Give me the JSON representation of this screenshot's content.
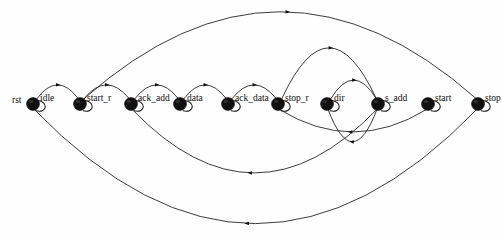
{
  "diagram": {
    "type": "finite-state-machine",
    "canvas": {
      "width": 502,
      "height": 237,
      "background": "#fefefe"
    },
    "stroke_color": "#1a1a1a",
    "node_fill": "#111111",
    "entry_label": "rst",
    "entry_label_x": 12,
    "entry_label_y": 103,
    "node_radius": 6.5,
    "node_row_y": 104,
    "nodes": [
      {
        "id": "idle",
        "label": "idle",
        "x": 33,
        "y": 104,
        "label_dx": 7,
        "label_dy": -3
      },
      {
        "id": "start_r",
        "label": "start_r",
        "x": 80,
        "y": 104,
        "label_dx": 7,
        "label_dy": -3
      },
      {
        "id": "ack_add",
        "label": "ack_add",
        "x": 131,
        "y": 104,
        "label_dx": 7,
        "label_dy": -3
      },
      {
        "id": "data",
        "label": "data",
        "x": 180,
        "y": 104,
        "label_dx": 7,
        "label_dy": -3
      },
      {
        "id": "ack_data",
        "label": "ack_data",
        "x": 228,
        "y": 104,
        "label_dx": 7,
        "label_dy": -3
      },
      {
        "id": "stop_r",
        "label": "stop_r",
        "x": 278,
        "y": 104,
        "label_dx": 7,
        "label_dy": -3
      },
      {
        "id": "dir",
        "label": "dir",
        "x": 327,
        "y": 104,
        "label_dx": 7,
        "label_dy": -3
      },
      {
        "id": "s_add",
        "label": "s_add",
        "x": 378,
        "y": 104,
        "label_dx": 7,
        "label_dy": -3
      },
      {
        "id": "start",
        "label": "start",
        "x": 428,
        "y": 104,
        "label_dx": 7,
        "label_dy": -3
      },
      {
        "id": "stop",
        "label": "stop",
        "x": 478,
        "y": 104,
        "label_dx": 7,
        "label_dy": -3
      }
    ],
    "self_loops": [
      {
        "node": "idle"
      },
      {
        "node": "start_r"
      },
      {
        "node": "ack_add"
      },
      {
        "node": "data"
      },
      {
        "node": "ack_data"
      },
      {
        "node": "stop_r"
      },
      {
        "node": "dir"
      },
      {
        "node": "s_add"
      },
      {
        "node": "start"
      },
      {
        "node": "stop"
      }
    ],
    "edges": [
      {
        "id": "e-idle-startr",
        "from": "idle",
        "to": "start_r",
        "direction": "right",
        "kind": "forward-short",
        "rise": 17
      },
      {
        "id": "e-startr-ackadd",
        "from": "start_r",
        "to": "ack_add",
        "direction": "right",
        "kind": "forward-short",
        "rise": 17
      },
      {
        "id": "e-ackadd-data",
        "from": "ack_add",
        "to": "data",
        "direction": "right",
        "kind": "forward-short",
        "rise": 17
      },
      {
        "id": "e-data-ackdata",
        "from": "data",
        "to": "ack_data",
        "direction": "right",
        "kind": "forward-short",
        "rise": 17
      },
      {
        "id": "e-ackdata-stopr",
        "from": "ack_data",
        "to": "stop_r",
        "direction": "right",
        "kind": "forward-short",
        "rise": 17
      },
      {
        "id": "e-dir-sadd",
        "from": "dir",
        "to": "s_add",
        "direction": "right",
        "kind": "forward-short",
        "rise": 22
      },
      {
        "id": "e-startr-stop",
        "from": "start_r",
        "to": "stop",
        "direction": "right",
        "kind": "forward-long-top",
        "rise": 92
      },
      {
        "id": "e-stopr-sadd",
        "from": "stop_r",
        "to": "s_add",
        "direction": "right",
        "kind": "forward-mid-top",
        "rise": 55
      },
      {
        "id": "e-sadd-dir",
        "from": "s_add",
        "to": "dir",
        "direction": "left",
        "kind": "return-short",
        "drop": 36
      },
      {
        "id": "e-start-stopr",
        "from": "start",
        "to": "stop_r",
        "direction": "left",
        "kind": "return-small",
        "drop": 26
      },
      {
        "id": "e-sadd-ackadd",
        "from": "s_add",
        "to": "ack_add",
        "direction": "left",
        "kind": "return-mid",
        "drop": 68
      },
      {
        "id": "e-stop-idle",
        "from": "stop",
        "to": "idle",
        "direction": "left",
        "kind": "return-long",
        "drop": 120
      }
    ]
  }
}
